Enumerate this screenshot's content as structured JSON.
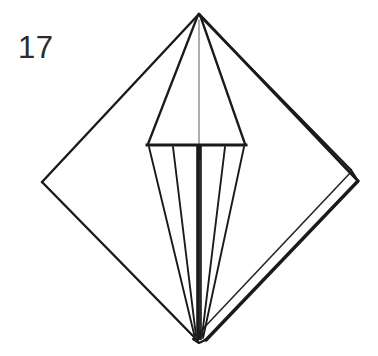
{
  "figure": {
    "step_number": "17",
    "colors": {
      "background": "#ffffff",
      "line": "#1a1a1a",
      "thin_line": "#3a3a3a",
      "number": "#2b2b2b"
    },
    "line_weights": {
      "outer_edge": 2.6,
      "thick_edge": 3.4,
      "inner_fold": 1.8,
      "hairline": 1.1,
      "center_stripe": 5.5
    },
    "geometry": {
      "apex": [
        199,
        14
      ],
      "bottom": [
        198,
        342
      ],
      "left_corner": [
        42,
        182
      ],
      "right_corner_outer": [
        358,
        181
      ],
      "right_corner_inner": [
        351,
        170
      ],
      "bar_left": [
        148,
        145
      ],
      "bar_right": [
        245,
        145
      ],
      "pleat_left_inner": [
        172,
        146
      ],
      "pleat_right_inner": [
        225,
        146
      ],
      "bar_y": 145,
      "center_x": 199
    },
    "labels": {
      "number_label": "17"
    }
  }
}
